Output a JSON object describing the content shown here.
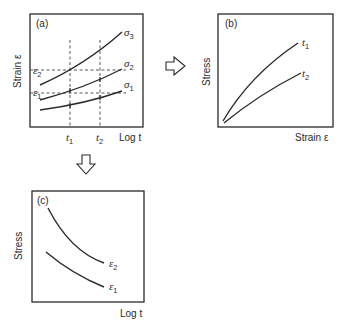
{
  "panels": {
    "a": {
      "tag": "(a)",
      "ylabel": "Strain ε",
      "xlabel": "Log t",
      "x_ticks": [
        {
          "sym": "t",
          "sub": "1"
        },
        {
          "sym": "t",
          "sub": "2"
        }
      ],
      "y_ticks": [
        {
          "sym": "ε",
          "sub": "2"
        },
        {
          "sym": "ε",
          "sub": "1"
        }
      ],
      "curves": [
        {
          "sym": "σ",
          "sub": "3"
        },
        {
          "sym": "σ",
          "sub": "2"
        },
        {
          "sym": "σ",
          "sub": "1"
        }
      ]
    },
    "b": {
      "tag": "(b)",
      "ylabel": "Stress",
      "xlabel": "Strain ε",
      "curves": [
        {
          "sym": "t",
          "sub": "1"
        },
        {
          "sym": "t",
          "sub": "2"
        }
      ]
    },
    "c": {
      "tag": "(c)",
      "ylabel": "Stress",
      "xlabel": "Log t",
      "curves": [
        {
          "sym": "ε",
          "sub": "2"
        },
        {
          "sym": "ε",
          "sub": "1"
        }
      ]
    }
  },
  "arrows": {
    "a_to_b": "right-arrow",
    "a_to_c": "down-arrow"
  }
}
